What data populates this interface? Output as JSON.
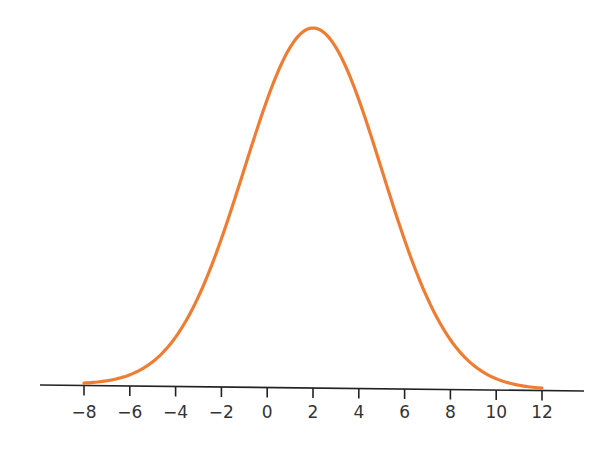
{
  "chart_data": {
    "type": "line",
    "title": "",
    "xlabel": "",
    "ylabel": "",
    "distribution": {
      "mean": 2,
      "sd": 3
    },
    "x_range": [
      -8,
      12
    ],
    "xticks": [
      -8,
      -6,
      -4,
      -2,
      0,
      2,
      4,
      6,
      8,
      10,
      12
    ],
    "xtick_labels": [
      "−8",
      "−6",
      "−4",
      "−2",
      "0",
      "2",
      "4",
      "6",
      "8",
      "10",
      "12"
    ],
    "yaxis_visible": false,
    "grid": false,
    "series": [
      {
        "name": "normal-curve",
        "color": "#ee7d34",
        "x": [
          -8,
          -6,
          -4,
          -2,
          0,
          2,
          4,
          6,
          8,
          10,
          12
        ],
        "values": [
          0.0004,
          0.0038,
          0.018,
          0.0547,
          0.1065,
          0.133,
          0.1065,
          0.0547,
          0.018,
          0.0038,
          0.0004
        ]
      }
    ]
  },
  "style": {
    "curve_color": "#ee7d34",
    "axis_color": "#222222",
    "label_color": "#333333"
  }
}
